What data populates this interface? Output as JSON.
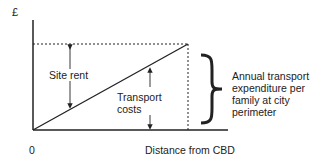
{
  "diagram": {
    "y_axis_label": "£",
    "origin_label": "0",
    "x_axis_label": "Distance from CBD",
    "regions": {
      "site_rent": "Site rent",
      "transport_costs_line1": "Transport",
      "transport_costs_line2": "costs"
    },
    "brace_annotation": {
      "lines": [
        "Annual transport",
        "expenditure per",
        "family at city",
        "perimeter"
      ]
    },
    "colors": {
      "line": "#222222",
      "text": "#222222",
      "background": "#ffffff"
    }
  }
}
